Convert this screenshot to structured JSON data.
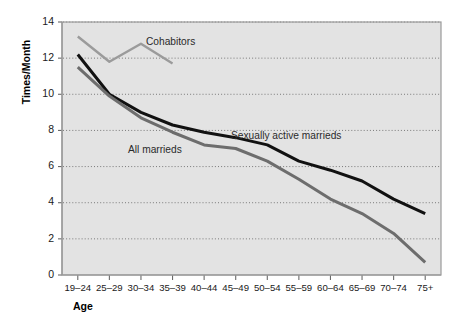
{
  "chart_data": {
    "type": "line",
    "title": "",
    "xlabel": "Age",
    "ylabel": "Times/Month",
    "categories": [
      "19–24",
      "25–29",
      "30–34",
      "35–39",
      "40–44",
      "45–49",
      "50–54",
      "55–59",
      "60–64",
      "65–69",
      "70–74",
      "75+"
    ],
    "ylim": [
      0,
      14
    ],
    "yticks": [
      0,
      2,
      4,
      6,
      8,
      10,
      12,
      14
    ],
    "ytick_labels": [
      "0",
      "2",
      "4",
      "6",
      "8",
      "10",
      "12",
      "14"
    ],
    "grid": "horizontal-dotted",
    "legend": "inline-annotations",
    "series": [
      {
        "name": "Cohabitors",
        "color": "#9b9b9b",
        "label_x_category": "35–39",
        "values": [
          13.2,
          11.8,
          12.8,
          11.7,
          null,
          null,
          null,
          null,
          null,
          null,
          null,
          null
        ]
      },
      {
        "name": "Sexually active marrieds",
        "color": "#111111",
        "values": [
          12.2,
          10.0,
          9.0,
          8.3,
          7.9,
          7.6,
          7.2,
          6.3,
          5.8,
          5.2,
          4.2,
          3.4
        ]
      },
      {
        "name": "All marrieds",
        "color": "#6d6d6d",
        "values": [
          11.5,
          9.9,
          8.7,
          7.9,
          7.2,
          7.0,
          6.3,
          5.3,
          4.2,
          3.4,
          2.3,
          0.7
        ]
      }
    ],
    "annotations": [
      {
        "text": "Cohabitors",
        "x": 146,
        "y": 45
      },
      {
        "text": "All marrieds",
        "x": 128,
        "y": 153
      },
      {
        "text": "Sexually active marrieds",
        "x": 231,
        "y": 139
      }
    ]
  },
  "colors": {
    "plot_background": "#e3e3e3",
    "page_background": "#ffffff",
    "grid": "#6e6e6e",
    "frame": "#9a9a9a",
    "cohabitors": "#9b9b9b",
    "sexually_active_marrieds": "#111111",
    "all_marrieds": "#6d6d6d"
  }
}
